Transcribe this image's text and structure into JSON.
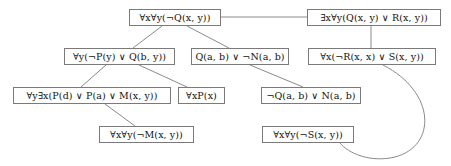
{
  "diagram": {
    "type": "resolution-proof-tree",
    "title": "",
    "nodes": [
      {
        "id": "n1",
        "label": "∀x∀y(¬Q(x, y))",
        "x": 129,
        "y": 9,
        "w": 92,
        "h": 17
      },
      {
        "id": "n2",
        "label": "∃x∀y(Q(x, y) ∨ R(x, y))",
        "x": 307,
        "y": 9,
        "w": 134,
        "h": 17
      },
      {
        "id": "n3",
        "label": "∀y(¬P(y) ∨ Q(b, y))",
        "x": 64,
        "y": 48,
        "w": 111,
        "h": 17
      },
      {
        "id": "n4",
        "label": "Q(a, b) ∨ ¬N(a, b)",
        "x": 191,
        "y": 48,
        "w": 98,
        "h": 17
      },
      {
        "id": "n5",
        "label": "∀x(¬R(x, x) ∨ S(x, y))",
        "x": 308,
        "y": 48,
        "w": 128,
        "h": 17
      },
      {
        "id": "n6",
        "label": "∀y∃x(P(d) ∨ P(a) ∨ M(x, y))",
        "x": 13,
        "y": 87,
        "w": 158,
        "h": 17
      },
      {
        "id": "n7",
        "label": "∀xP(x)",
        "x": 178,
        "y": 87,
        "w": 47,
        "h": 17
      },
      {
        "id": "n8",
        "label": "¬Q(a, b) ∨ N(a, b)",
        "x": 261,
        "y": 87,
        "w": 100,
        "h": 17
      },
      {
        "id": "n9",
        "label": "∀x∀y(¬M(x, y))",
        "x": 99,
        "y": 126,
        "w": 95,
        "h": 17
      },
      {
        "id": "n10",
        "label": "∀x∀y(¬S(x, y))",
        "x": 262,
        "y": 126,
        "w": 92,
        "h": 17
      }
    ],
    "edges": [
      {
        "from": "n1",
        "to": "n2",
        "kind": "straight",
        "path": "M 221 17 L 307 17"
      },
      {
        "from": "n1",
        "to": "n3",
        "kind": "straight",
        "path": "M 162 26 L 133 48"
      },
      {
        "from": "n1",
        "to": "n4",
        "kind": "straight",
        "path": "M 187 26 L 229 48"
      },
      {
        "from": "n2",
        "to": "n5",
        "kind": "straight",
        "path": "M 371 26 L 371 48"
      },
      {
        "from": "n3",
        "to": "n6",
        "kind": "straight",
        "path": "M 106 65 L 81 87"
      },
      {
        "from": "n3",
        "to": "n7",
        "kind": "straight",
        "path": "M 139 65 L 187 87"
      },
      {
        "from": "n4",
        "to": "n8",
        "kind": "straight",
        "path": "M 250 65 L 303 87"
      },
      {
        "from": "n6",
        "to": "n9",
        "kind": "straight",
        "path": "M 105 104 L 135 126"
      },
      {
        "from": "n5",
        "to": "n10",
        "kind": "curve",
        "path": "M 383 65 C 436 92, 437 146, 395 157 C 370 163, 348 153, 340 143"
      }
    ],
    "style": {
      "box_border_color": "#7a7a7a",
      "edge_color": "#8a8a8a",
      "text_color": "#111111",
      "background": "#ffffff"
    }
  }
}
